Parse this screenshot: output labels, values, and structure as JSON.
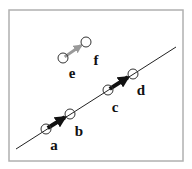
{
  "diagram": {
    "frame": {
      "x": 9,
      "y": 10,
      "width": 174,
      "height": 151,
      "stroke": "#b0b0b0"
    },
    "line": {
      "x1": 16,
      "y1": 149,
      "x2": 176,
      "y2": 47,
      "stroke": "#222222"
    },
    "points": [
      {
        "id": "a",
        "cx": 46,
        "cy": 129,
        "label": "a",
        "lx": 54,
        "ly": 150
      },
      {
        "id": "b",
        "cx": 70,
        "cy": 114,
        "label": "b",
        "lx": 79,
        "ly": 136
      },
      {
        "id": "c",
        "cx": 108,
        "cy": 90,
        "label": "c",
        "lx": 115,
        "ly": 112
      },
      {
        "id": "d",
        "cx": 133,
        "cy": 74,
        "label": "d",
        "lx": 141,
        "ly": 95
      },
      {
        "id": "e",
        "cx": 63,
        "cy": 58,
        "label": "e",
        "lx": 72,
        "ly": 78
      },
      {
        "id": "f",
        "cx": 86,
        "cy": 42,
        "label": "f",
        "lx": 96,
        "ly": 65
      }
    ],
    "arrows": [
      {
        "from": "a",
        "to": "b",
        "color": "#111111",
        "width": 4
      },
      {
        "from": "c",
        "to": "d",
        "color": "#111111",
        "width": 4
      },
      {
        "from": "e",
        "to": "f",
        "color": "#999999",
        "width": 3
      }
    ],
    "circle_radius": 5,
    "circle_stroke": "#333333"
  }
}
